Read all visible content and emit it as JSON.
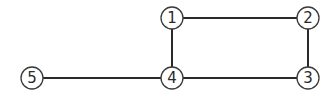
{
  "graph": {
    "nodes": [
      {
        "id": "1",
        "label": "1",
        "x": 172,
        "y": 18
      },
      {
        "id": "2",
        "label": "2",
        "x": 308,
        "y": 18
      },
      {
        "id": "3",
        "label": "3",
        "x": 308,
        "y": 78
      },
      {
        "id": "4",
        "label": "4",
        "x": 172,
        "y": 78
      },
      {
        "id": "5",
        "label": "5",
        "x": 32,
        "y": 78
      }
    ],
    "edges": [
      {
        "from": "1",
        "to": "2"
      },
      {
        "from": "2",
        "to": "3"
      },
      {
        "from": "3",
        "to": "4"
      },
      {
        "from": "4",
        "to": "1"
      },
      {
        "from": "4",
        "to": "5"
      }
    ],
    "node_radius": 11,
    "colors": {
      "edge": "#2a2a2a",
      "node_stroke": "#3a3a3a",
      "node_fill": "#ffffff",
      "background": "#ffffff"
    }
  }
}
